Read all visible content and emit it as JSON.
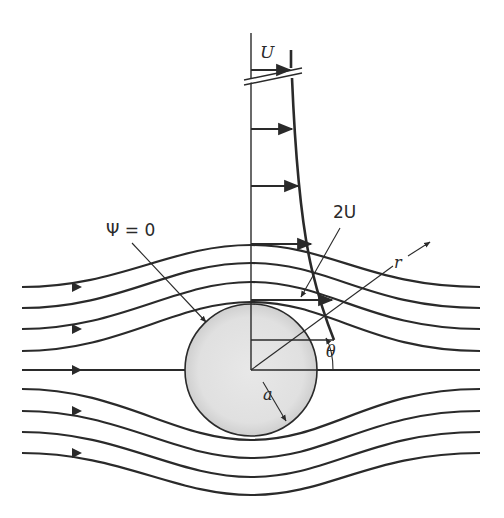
{
  "figure": {
    "labels": {
      "freestream_velocity": "U",
      "surface_velocity": "2U",
      "stream_function": "Ψ = 0",
      "radius_coord": "r",
      "angle_coord": "θ",
      "cylinder_radius": "a"
    },
    "colors": {
      "line": "#2a2a2a",
      "cylinder_fill": "#d8d8d8",
      "cylinder_inner": "#e6e6e6",
      "background": "#ffffff"
    }
  }
}
